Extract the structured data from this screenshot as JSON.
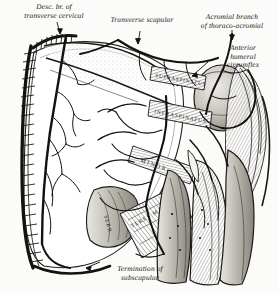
{
  "plate": {
    "title": "Scapular arterial anastomosis",
    "background_color": "#fbfbfa",
    "ink_color": "#17150f",
    "width": 279,
    "height": 293
  },
  "labels": {
    "desc_transverse_cervical": "Desc. br. of\ntransverse cervical",
    "transverse_scapular": "Transverse scapular",
    "acromial_thoracoacromial": "Acromial branch\nof thoraco-acromial",
    "anterior_humeral_circumflex": "Anterior\nhumeral\ncircumflex",
    "termination_subscapular": "Termination of\nsubscapular"
  },
  "muscle_labels": {
    "supraspinatus": "SUPRASPINATUS",
    "infraspinatus": "INFRASPINATUS",
    "teres_minor": "MINOR",
    "serratus": "SERR.",
    "teres_major": "TERES MAJOR"
  },
  "legend": {
    "artery_color": "#141210",
    "muscle_tone": "#8d8a83",
    "bone_tone": "#cfccc4"
  }
}
